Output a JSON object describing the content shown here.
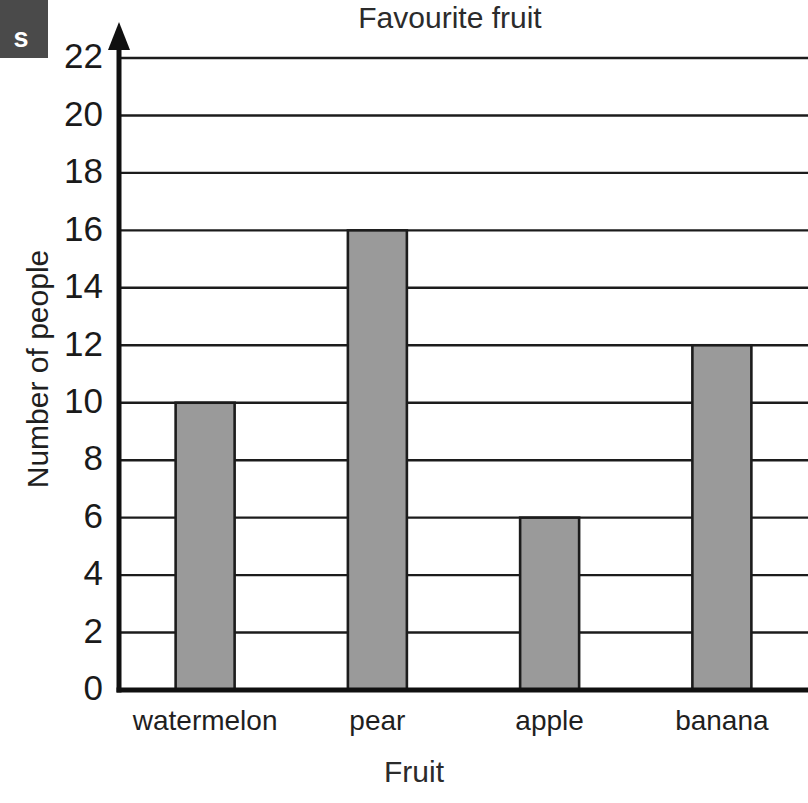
{
  "page_tab": {
    "letter": "s"
  },
  "chart_data": {
    "type": "bar",
    "title": "Favourite fruit",
    "xlabel": "Fruit",
    "ylabel": "Number of people",
    "categories": [
      "watermelon",
      "pear",
      "apple",
      "banana"
    ],
    "values": [
      10,
      16,
      6,
      12
    ],
    "ylim": [
      0,
      22
    ],
    "ytick_step": 2,
    "yticks": [
      0,
      2,
      4,
      6,
      8,
      10,
      12,
      14,
      16,
      18,
      20,
      22
    ],
    "ytick_labels": [
      "0",
      "2",
      "4",
      "6",
      "8",
      "10",
      "12",
      "14",
      "16",
      "18",
      "20",
      "22"
    ],
    "grid": true,
    "grid_axis": "y",
    "legend": false,
    "bar_color": "#9a9a9a",
    "bar_edge_color": "#1c1c1c",
    "axis_color": "#101010",
    "gridline_color": "#1c1c1c",
    "y_axis_has_arrow": true
  }
}
